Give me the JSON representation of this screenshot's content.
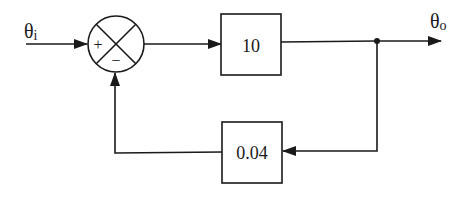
{
  "diagram": {
    "type": "block-diagram",
    "title": "",
    "input_signal": {
      "symbol": "θ",
      "subscript": "i"
    },
    "output_signal": {
      "symbol": "θ",
      "subscript": "o"
    },
    "summing_junction": {
      "plus_sign": "+",
      "minus_sign": "−"
    },
    "forward_block": {
      "gain": "10"
    },
    "feedback_block": {
      "gain": "0.04"
    },
    "colors": {
      "line": "#1a1a1a",
      "background": "#ffffff"
    }
  }
}
